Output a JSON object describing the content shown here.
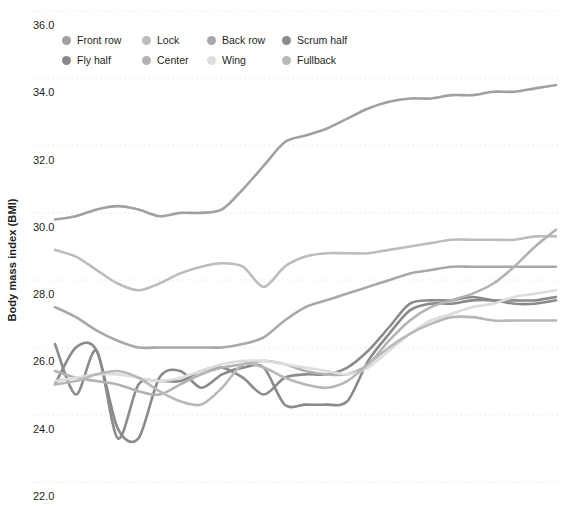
{
  "chart_data": {
    "type": "line",
    "title": "",
    "xlabel": "",
    "ylabel": "Body mass index (BMI)",
    "ylim": [
      22.0,
      36.0
    ],
    "xlim": [
      0,
      24
    ],
    "grid": true,
    "legend_position": "top-left",
    "ytick_labels": [
      "36.0",
      "34.0",
      "32.0",
      "30.0",
      "28.0",
      "26.0",
      "24.0",
      "22.0"
    ],
    "ytick_values": [
      36.0,
      34.0,
      32.0,
      30.0,
      28.0,
      26.0,
      24.0,
      22.0
    ],
    "xtick_labels": [],
    "x": [
      0,
      1,
      2,
      3,
      4,
      5,
      6,
      7,
      8,
      9,
      10,
      11,
      12,
      13,
      14,
      15,
      16,
      17,
      18,
      19,
      20,
      21,
      22,
      23,
      24
    ],
    "series": [
      {
        "name": "Front row",
        "color": "#a0a0a0",
        "values": [
          29.8,
          29.9,
          30.1,
          30.2,
          30.1,
          29.9,
          30.0,
          30.0,
          30.1,
          30.7,
          31.4,
          32.1,
          32.3,
          32.5,
          32.8,
          33.1,
          33.3,
          33.4,
          33.4,
          33.5,
          33.5,
          33.6,
          33.6,
          33.7,
          33.8
        ]
      },
      {
        "name": "Lock",
        "color": "#bcbcbc",
        "values": [
          28.9,
          28.7,
          28.3,
          27.9,
          27.7,
          27.9,
          28.2,
          28.4,
          28.5,
          28.4,
          27.8,
          28.4,
          28.7,
          28.8,
          28.8,
          28.8,
          28.9,
          29.0,
          29.1,
          29.2,
          29.2,
          29.2,
          29.2,
          29.3,
          29.3
        ]
      },
      {
        "name": "Back row",
        "color": "#a8a8a8",
        "values": [
          27.2,
          26.9,
          26.5,
          26.2,
          26.0,
          26.0,
          26.0,
          26.0,
          26.0,
          26.1,
          26.3,
          26.8,
          27.2,
          27.4,
          27.6,
          27.8,
          28.0,
          28.2,
          28.3,
          28.4,
          28.4,
          28.4,
          28.4,
          28.4,
          28.4
        ]
      },
      {
        "name": "Scrum half",
        "color": "#8c8c8c",
        "values": [
          26.1,
          24.6,
          25.9,
          23.3,
          24.9,
          25.0,
          25.0,
          25.3,
          25.4,
          25.1,
          24.6,
          25.1,
          25.2,
          25.2,
          25.4,
          25.9,
          26.6,
          27.3,
          27.4,
          27.4,
          27.5,
          27.4,
          27.4,
          27.4,
          27.5
        ]
      },
      {
        "name": "Fly half",
        "color": "#8a8a8a",
        "values": [
          24.9,
          26.0,
          25.9,
          23.6,
          23.3,
          25.1,
          25.3,
          24.8,
          25.2,
          25.4,
          25.4,
          24.3,
          24.3,
          24.3,
          24.4,
          25.6,
          26.4,
          27.1,
          27.3,
          27.3,
          27.4,
          27.4,
          27.3,
          27.3,
          27.4
        ]
      },
      {
        "name": "Center",
        "color": "#b2b2b2",
        "values": [
          25.3,
          25.1,
          25.0,
          24.9,
          24.7,
          24.6,
          24.9,
          25.2,
          25.4,
          25.5,
          25.6,
          25.5,
          25.3,
          25.2,
          25.2,
          25.5,
          26.2,
          26.8,
          27.2,
          27.4,
          27.6,
          27.9,
          28.4,
          29.0,
          29.5
        ]
      },
      {
        "name": "Wing",
        "color": "#dddddd",
        "values": [
          25.0,
          25.1,
          25.2,
          25.2,
          25.1,
          25.0,
          25.1,
          25.3,
          25.5,
          25.6,
          25.6,
          25.5,
          25.4,
          25.3,
          25.2,
          25.4,
          25.9,
          26.4,
          26.8,
          27.0,
          27.2,
          27.3,
          27.5,
          27.6,
          27.7
        ]
      },
      {
        "name": "Fullback",
        "color": "#b8b8b8",
        "values": [
          24.9,
          25.0,
          25.2,
          25.3,
          25.1,
          24.7,
          24.4,
          24.3,
          24.8,
          25.5,
          25.4,
          25.1,
          24.9,
          24.8,
          25.0,
          25.5,
          26.0,
          26.4,
          26.7,
          26.9,
          26.9,
          26.8,
          26.8,
          26.8,
          26.8
        ]
      }
    ]
  },
  "legend": {
    "rows": [
      [
        {
          "label": "Front row",
          "color": "#a0a0a0"
        },
        {
          "label": "Lock",
          "color": "#bcbcbc"
        },
        {
          "label": "Back row",
          "color": "#a8a8a8"
        },
        {
          "label": "Scrum half",
          "color": "#8c8c8c"
        }
      ],
      [
        {
          "label": "Fly half",
          "color": "#8a8a8a"
        },
        {
          "label": "Center",
          "color": "#b2b2b2"
        },
        {
          "label": "Wing",
          "color": "#dddddd"
        },
        {
          "label": "Fullback",
          "color": "#b8b8b8"
        }
      ]
    ]
  },
  "colors": {
    "background": "#ffffff",
    "grid": "#f0eef2",
    "text": "#231f20"
  }
}
